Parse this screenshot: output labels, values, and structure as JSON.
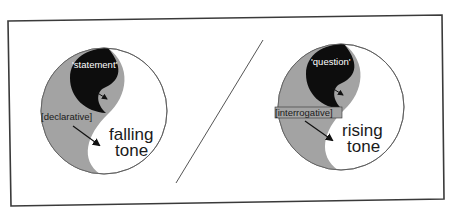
{
  "diagram": {
    "colors": {
      "frame": "#3a3a3a",
      "gray_region": "#a3a3a3",
      "black_region": "#0d0d0d",
      "white_region": "#ffffff",
      "divider_line": "#555555"
    },
    "panels": [
      {
        "id": "left",
        "quoted_label": "'statement'",
        "bracket_label": "[declarative]",
        "tone_line1": "falling",
        "tone_line2": "tone"
      },
      {
        "id": "right",
        "quoted_label": "'question'",
        "bracket_label": "[interrogative]",
        "tone_line1": "rising",
        "tone_line2": "tone"
      }
    ],
    "separator": "/"
  }
}
